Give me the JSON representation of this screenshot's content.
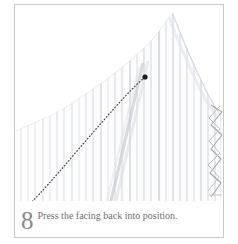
{
  "figure": {
    "step_number": "8",
    "caption": "Press the facing back into position.",
    "border_color": "#c9c9c9",
    "background_color": "#ffffff",
    "caption_color": "#6f6f6f",
    "step_number_color": "#8a8a8a"
  },
  "illustration": {
    "subject": "pinstriped-fabric-facing",
    "fabric_stripe_color": "#d8dadd",
    "fabric_shadow_color": "#c3c7cb",
    "arrow_color": "#3a3a3a",
    "stitch_color": "#9aa0a6",
    "arrow": {
      "name": "dotted-curved-arrow",
      "tip_x": 130,
      "tip_y": 72,
      "tail_x": 22,
      "tail_y": 205
    },
    "basting_stitches": {
      "name": "zigzag-basting-stitches",
      "x": 196,
      "y_start": 100,
      "y_end": 192
    },
    "fabric_edge": {
      "name": "facing-edge-curve",
      "top_x": 158,
      "top_y": 10,
      "bottom_x": 206,
      "bottom_y": 110
    }
  }
}
